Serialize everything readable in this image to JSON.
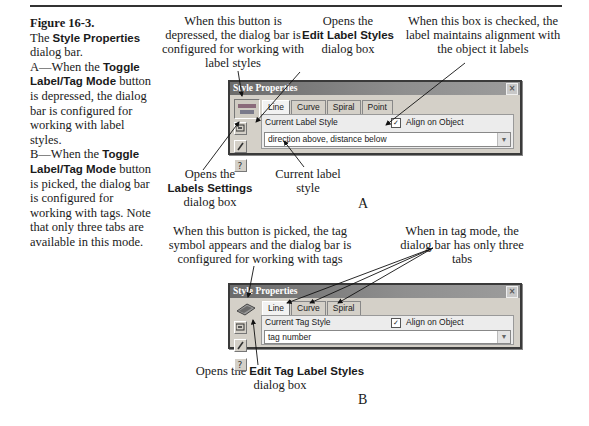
{
  "figure": {
    "number": "Figure 16-3.",
    "caption_parts": {
      "p1": "The ",
      "p1_bold": "Style Properties",
      "p2": " dialog bar.",
      "a_intro": "A—When the ",
      "a_bold": "Toggle Label/Tag Mode",
      "a_rest": " button is depressed, the dialog bar is configured for working with label styles.",
      "b_intro": "B—When the ",
      "b_bold": "Toggle Label/Tag Mode",
      "b_rest": " button is picked, the dialog bar is configured for working with tags. Note that only three tabs are available in this mode."
    }
  },
  "panel_a": {
    "letter": "A",
    "callouts": {
      "depressed": "When this button is depressed, the dialog bar is configured for working with label styles",
      "opens_edit_pre": "Opens the",
      "opens_edit_bold": "Edit Label Styles",
      "opens_edit_post": "dialog box",
      "checkbox": "When this box is checked, the label maintains alignment with the object it labels",
      "labels_settings_pre": "Opens the",
      "labels_settings_bold": "Labels Settings",
      "labels_settings_post": "dialog box",
      "current_style": "Current label style"
    },
    "dialog": {
      "title": "Style Properties",
      "close_glyph": "×",
      "tabs": [
        "Line",
        "Curve",
        "Spiral",
        "Point"
      ],
      "active_tab": "Line",
      "style_label": "Current Label Style",
      "align_checkbox_label": "Align on Object",
      "align_checked": true,
      "check_glyph": "✓",
      "combo_value": "direction above, distance below",
      "combo_arrow": "▼"
    }
  },
  "panel_b": {
    "letter": "B",
    "callouts": {
      "picked": "When this button is picked, the tag symbol appears and the dialog bar is configured for working with tags",
      "tag_mode": "When in tag mode, the dialog bar has only three tabs",
      "edit_tag_pre": "Opens the ",
      "edit_tag_bold": "Edit Tag Label Styles",
      "edit_tag_post": "dialog box"
    },
    "dialog": {
      "title": "Style Properties",
      "close_glyph": "×",
      "tabs": [
        "Line",
        "Curve",
        "Spiral"
      ],
      "active_tab": "Line",
      "style_label": "Current Tag Style",
      "align_checkbox_label": "Align on Object",
      "align_checked": true,
      "check_glyph": "✓",
      "combo_value": "tag number",
      "combo_arrow": "▼"
    }
  },
  "icons": {
    "toggle_label_mode": "label-mode-icon",
    "toggle_tag_mode": "tag-icon",
    "labels_settings": "settings-icon",
    "edit_styles": "pencil-icon",
    "help": "help-icon"
  }
}
